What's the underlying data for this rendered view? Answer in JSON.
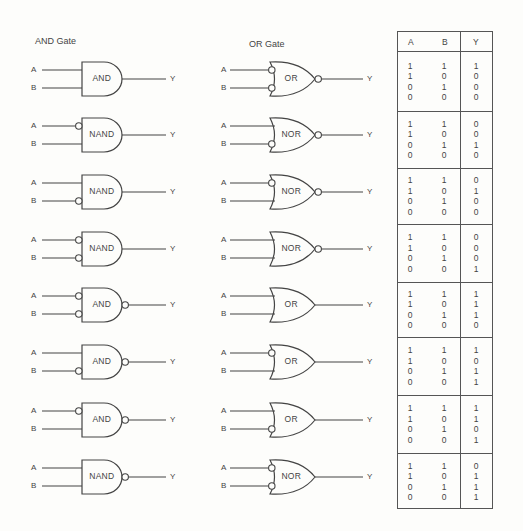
{
  "titles": {
    "and_column": "AND Gate",
    "or_column": "OR Gate"
  },
  "input_labels": {
    "a": "A",
    "b": "B",
    "y": "Y"
  },
  "gate_rows": [
    {
      "left": {
        "name": "AND",
        "shape": "and",
        "inv_a": false,
        "inv_b": false,
        "inv_out": false
      },
      "right": {
        "name": "OR",
        "shape": "or",
        "inv_a": true,
        "inv_b": true,
        "inv_out": true
      }
    },
    {
      "left": {
        "name": "NAND",
        "shape": "and",
        "inv_a": true,
        "inv_b": false,
        "inv_out": false
      },
      "right": {
        "name": "NOR",
        "shape": "or",
        "inv_a": false,
        "inv_b": true,
        "inv_out": true
      }
    },
    {
      "left": {
        "name": "NAND",
        "shape": "and",
        "inv_a": false,
        "inv_b": true,
        "inv_out": false
      },
      "right": {
        "name": "NOR",
        "shape": "or",
        "inv_a": true,
        "inv_b": false,
        "inv_out": true
      }
    },
    {
      "left": {
        "name": "NAND",
        "shape": "and",
        "inv_a": true,
        "inv_b": true,
        "inv_out": false
      },
      "right": {
        "name": "NOR",
        "shape": "or",
        "inv_a": false,
        "inv_b": false,
        "inv_out": true
      }
    },
    {
      "left": {
        "name": "AND",
        "shape": "and",
        "inv_a": true,
        "inv_b": true,
        "inv_out": true
      },
      "right": {
        "name": "OR",
        "shape": "or",
        "inv_a": false,
        "inv_b": false,
        "inv_out": false
      }
    },
    {
      "left": {
        "name": "AND",
        "shape": "and",
        "inv_a": false,
        "inv_b": true,
        "inv_out": true
      },
      "right": {
        "name": "OR",
        "shape": "or",
        "inv_a": true,
        "inv_b": false,
        "inv_out": false
      }
    },
    {
      "left": {
        "name": "AND",
        "shape": "and",
        "inv_a": true,
        "inv_b": false,
        "inv_out": true
      },
      "right": {
        "name": "OR",
        "shape": "or",
        "inv_a": false,
        "inv_b": true,
        "inv_out": false
      }
    },
    {
      "left": {
        "name": "NAND",
        "shape": "and",
        "inv_a": false,
        "inv_b": false,
        "inv_out": true
      },
      "right": {
        "name": "NOR",
        "shape": "or",
        "inv_a": true,
        "inv_b": true,
        "inv_out": false
      }
    }
  ],
  "truth_table": {
    "headers": [
      "A",
      "B",
      "Y"
    ],
    "a_column": [
      "1",
      "1",
      "0",
      "0"
    ],
    "b_column": [
      "1",
      "0",
      "1",
      "0"
    ],
    "blocks": [
      {
        "y": [
          "1",
          "0",
          "0",
          "0"
        ]
      },
      {
        "y": [
          "0",
          "0",
          "1",
          "0"
        ]
      },
      {
        "y": [
          "0",
          "1",
          "0",
          "0"
        ]
      },
      {
        "y": [
          "0",
          "0",
          "0",
          "1"
        ]
      },
      {
        "y": [
          "1",
          "1",
          "1",
          "0"
        ]
      },
      {
        "y": [
          "1",
          "0",
          "1",
          "1"
        ]
      },
      {
        "y": [
          "1",
          "1",
          "0",
          "1"
        ]
      },
      {
        "y": [
          "0",
          "1",
          "1",
          "1"
        ]
      }
    ]
  },
  "colors": {
    "ink": "#444444",
    "background": "#fdfdfb"
  }
}
